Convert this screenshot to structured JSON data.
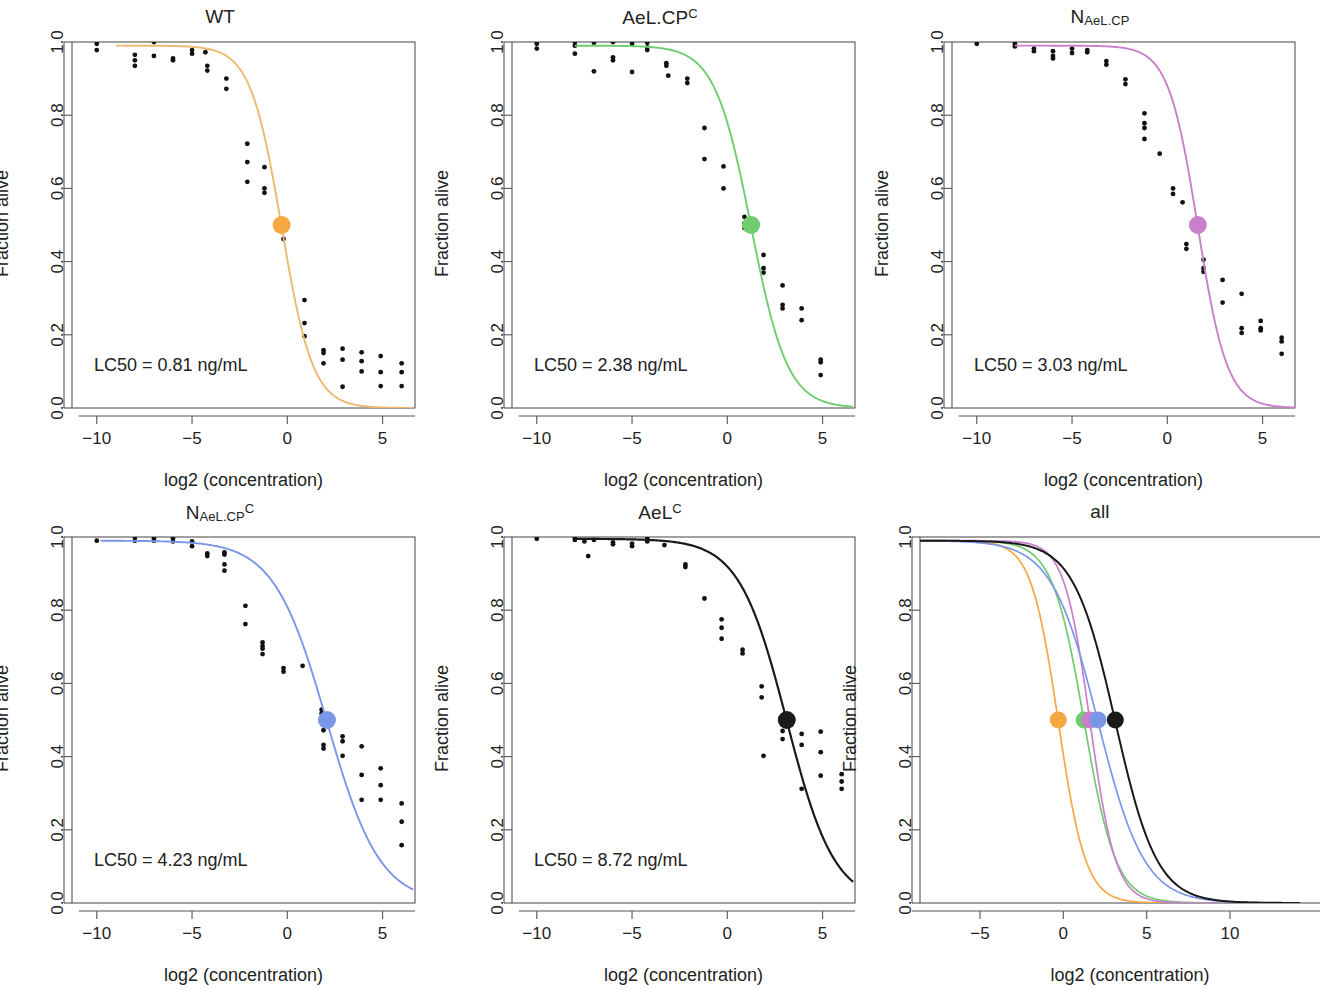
{
  "figure": {
    "axis_labels": {
      "x": "log2 (concentration)",
      "y": "Fraction alive"
    },
    "colors": {
      "wt": "#F5A742",
      "wt_curve": "#EEB96E",
      "aelcpc": "#6FCC6F",
      "n_aelcp": "#C97FC9",
      "n_aelcpc": "#7B96E8",
      "aelc": "#1A1A1A",
      "points": "#111111",
      "axis": "#555555"
    }
  },
  "chart_data": {
    "type": "line",
    "xlabel": "log2 (concentration)",
    "ylabel": "Fraction alive",
    "ylim": [
      0.0,
      1.0
    ],
    "yticks": [
      "0.0",
      "0.2",
      "0.4",
      "0.6",
      "0.8",
      "1.0"
    ],
    "ytick_values": [
      0.0,
      0.2,
      0.4,
      0.6,
      0.8,
      1.0
    ],
    "grid": false,
    "legend": "none",
    "panels": [
      {
        "id": "wt",
        "title_main": "WT",
        "title_sub": "",
        "title_sup": "",
        "lc50_label": "LC50 = 0.81 ng/mL",
        "lc50_value": 0.81,
        "lc50_log2": -0.3,
        "color": "#F5A742",
        "curve_color": "#EEB96E",
        "xlim": [
          -11.3,
          6.7
        ],
        "xticks": [
          "-10",
          "-5",
          "0",
          "5"
        ],
        "xtick_values": [
          -10,
          -5,
          0,
          5
        ],
        "hill_slope": 1.22,
        "top": 0.99,
        "bottom": 0.0,
        "curve_x_range": [
          -9.0,
          6.6
        ],
        "points": [
          [
            -10.0,
            0.995
          ],
          [
            -10.0,
            0.978
          ],
          [
            -8.0,
            0.965
          ],
          [
            -8.0,
            0.95
          ],
          [
            -8.0,
            0.935
          ],
          [
            -7.0,
            1.0
          ],
          [
            -7.0,
            0.962
          ],
          [
            -6.0,
            0.955
          ],
          [
            -6.0,
            0.95
          ],
          [
            -5.0,
            0.978
          ],
          [
            -5.0,
            0.968
          ],
          [
            -4.3,
            0.972
          ],
          [
            -4.2,
            0.935
          ],
          [
            -4.2,
            0.922
          ],
          [
            -3.2,
            0.9
          ],
          [
            -3.2,
            0.872
          ],
          [
            -2.1,
            0.722
          ],
          [
            -2.1,
            0.672
          ],
          [
            -2.1,
            0.618
          ],
          [
            -1.2,
            0.658
          ],
          [
            -1.2,
            0.6
          ],
          [
            -1.2,
            0.588
          ],
          [
            -0.2,
            0.493
          ],
          [
            -0.2,
            0.462
          ],
          [
            0.9,
            0.295
          ],
          [
            0.9,
            0.232
          ],
          [
            0.9,
            0.196
          ],
          [
            1.9,
            0.158
          ],
          [
            1.9,
            0.15
          ],
          [
            1.9,
            0.122
          ],
          [
            2.9,
            0.162
          ],
          [
            2.9,
            0.132
          ],
          [
            2.9,
            0.058
          ],
          [
            3.9,
            0.152
          ],
          [
            3.9,
            0.128
          ],
          [
            3.9,
            0.1
          ],
          [
            4.9,
            0.142
          ],
          [
            4.9,
            0.098
          ],
          [
            4.9,
            0.06
          ],
          [
            6.0,
            0.122
          ],
          [
            6.0,
            0.098
          ],
          [
            6.0,
            0.06
          ]
        ]
      },
      {
        "id": "aelcpc",
        "title_main": "AeL.CP",
        "title_sub": "",
        "title_sup": "C",
        "lc50_label": "LC50 = 2.38 ng/mL",
        "lc50_value": 2.38,
        "lc50_log2": 1.25,
        "color": "#6FCC6F",
        "curve_color": "#6FCC6F",
        "xlim": [
          -11.3,
          6.7
        ],
        "xticks": [
          "-10",
          "-5",
          "0",
          "5"
        ],
        "xtick_values": [
          -10,
          -5,
          0,
          5
        ],
        "hill_slope": 1.05,
        "top": 0.99,
        "bottom": 0.0,
        "curve_x_range": [
          -8.0,
          6.6
        ],
        "points": [
          [
            -10.0,
            0.995
          ],
          [
            -10.0,
            0.982
          ],
          [
            -8.0,
            1.0
          ],
          [
            -8.0,
            0.99
          ],
          [
            -8.0,
            0.968
          ],
          [
            -7.0,
            0.998
          ],
          [
            -7.0,
            0.92
          ],
          [
            -6.0,
            1.0
          ],
          [
            -6.0,
            0.958
          ],
          [
            -6.0,
            0.95
          ],
          [
            -5.0,
            0.995
          ],
          [
            -5.0,
            0.918
          ],
          [
            -4.2,
            0.998
          ],
          [
            -4.2,
            0.985
          ],
          [
            -4.2,
            0.978
          ],
          [
            -3.2,
            0.942
          ],
          [
            -3.2,
            0.935
          ],
          [
            -3.1,
            0.908
          ],
          [
            -2.1,
            0.9
          ],
          [
            -2.1,
            0.888
          ],
          [
            -1.2,
            0.765
          ],
          [
            -1.2,
            0.68
          ],
          [
            -0.2,
            0.66
          ],
          [
            -0.2,
            0.6
          ],
          [
            0.9,
            0.522
          ],
          [
            0.9,
            0.505
          ],
          [
            0.9,
            0.492
          ],
          [
            1.9,
            0.418
          ],
          [
            1.9,
            0.382
          ],
          [
            1.9,
            0.37
          ],
          [
            2.9,
            0.335
          ],
          [
            2.9,
            0.282
          ],
          [
            2.9,
            0.272
          ],
          [
            3.9,
            0.272
          ],
          [
            3.9,
            0.24
          ],
          [
            4.9,
            0.132
          ],
          [
            4.9,
            0.125
          ],
          [
            4.9,
            0.09
          ]
        ]
      },
      {
        "id": "n_aelcp",
        "title_main": "N",
        "title_sub": "AeL.CP",
        "title_sup": "",
        "lc50_label": "LC50 = 3.03 ng/mL",
        "lc50_value": 3.03,
        "lc50_log2": 1.6,
        "color": "#C97FC9",
        "curve_color": "#C97FC9",
        "xlim": [
          -11.3,
          6.7
        ],
        "xticks": [
          "-10",
          "-5",
          "0",
          "5"
        ],
        "xtick_values": [
          -10,
          -5,
          0,
          5
        ],
        "hill_slope": 1.3,
        "top": 0.99,
        "bottom": 0.0,
        "curve_x_range": [
          -8.0,
          7.2
        ],
        "points": [
          [
            -10.0,
            0.995
          ],
          [
            -8.0,
            0.995
          ],
          [
            -8.0,
            0.988
          ],
          [
            -7.0,
            0.982
          ],
          [
            -7.0,
            0.975
          ],
          [
            -6.0,
            0.975
          ],
          [
            -6.0,
            0.962
          ],
          [
            -6.0,
            0.955
          ],
          [
            -5.0,
            0.982
          ],
          [
            -5.0,
            0.97
          ],
          [
            -4.2,
            0.978
          ],
          [
            -4.2,
            0.972
          ],
          [
            -3.2,
            0.948
          ],
          [
            -3.2,
            0.938
          ],
          [
            -2.2,
            0.898
          ],
          [
            -2.2,
            0.885
          ],
          [
            -1.2,
            0.805
          ],
          [
            -1.2,
            0.778
          ],
          [
            -1.2,
            0.765
          ],
          [
            -1.2,
            0.735
          ],
          [
            -0.4,
            0.695
          ],
          [
            0.3,
            0.6
          ],
          [
            0.3,
            0.585
          ],
          [
            0.8,
            0.562
          ],
          [
            1.0,
            0.448
          ],
          [
            1.0,
            0.435
          ],
          [
            1.9,
            0.405
          ],
          [
            1.9,
            0.382
          ],
          [
            1.9,
            0.372
          ],
          [
            2.9,
            0.35
          ],
          [
            2.9,
            0.288
          ],
          [
            3.9,
            0.312
          ],
          [
            3.9,
            0.218
          ],
          [
            3.9,
            0.205
          ],
          [
            4.9,
            0.238
          ],
          [
            4.9,
            0.218
          ],
          [
            4.9,
            0.212
          ],
          [
            6.0,
            0.192
          ],
          [
            6.0,
            0.182
          ],
          [
            6.0,
            0.148
          ]
        ]
      },
      {
        "id": "n_aelcpc",
        "title_main": "N",
        "title_sub": "AeL.CP",
        "title_sup": "C",
        "lc50_label": "LC50 = 4.23 ng/mL",
        "lc50_value": 4.23,
        "lc50_log2": 2.08,
        "color": "#7B96E8",
        "curve_color": "#7B96E8",
        "xlim": [
          -11.3,
          6.7
        ],
        "xticks": [
          "-10",
          "-5",
          "0",
          "5"
        ],
        "xtick_values": [
          -10,
          -5,
          0,
          5
        ],
        "hill_slope": 0.72,
        "top": 0.99,
        "bottom": 0.0,
        "curve_x_range": [
          -9.8,
          6.6
        ],
        "points": [
          [
            -10.0,
            0.99
          ],
          [
            -8.0,
            1.0
          ],
          [
            -8.0,
            0.99
          ],
          [
            -7.0,
            0.995
          ],
          [
            -7.0,
            0.99
          ],
          [
            -6.0,
            0.995
          ],
          [
            -6.0,
            0.988
          ],
          [
            -5.0,
            0.988
          ],
          [
            -5.0,
            0.975
          ],
          [
            -4.2,
            0.955
          ],
          [
            -4.2,
            0.948
          ],
          [
            -3.3,
            0.958
          ],
          [
            -3.3,
            0.952
          ],
          [
            -3.3,
            0.925
          ],
          [
            -3.3,
            0.908
          ],
          [
            -2.2,
            0.812
          ],
          [
            -2.2,
            0.762
          ],
          [
            -1.3,
            0.712
          ],
          [
            -1.3,
            0.702
          ],
          [
            -1.3,
            0.68
          ],
          [
            -1.3,
            0.695
          ],
          [
            -0.2,
            0.642
          ],
          [
            -0.2,
            0.632
          ],
          [
            0.8,
            0.648
          ],
          [
            1.8,
            0.528
          ],
          [
            1.8,
            0.518
          ],
          [
            1.9,
            0.472
          ],
          [
            1.9,
            0.432
          ],
          [
            1.9,
            0.422
          ],
          [
            2.9,
            0.455
          ],
          [
            2.9,
            0.442
          ],
          [
            2.9,
            0.402
          ],
          [
            3.9,
            0.428
          ],
          [
            3.9,
            0.35
          ],
          [
            4.9,
            0.368
          ],
          [
            4.9,
            0.322
          ],
          [
            4.9,
            0.282
          ],
          [
            3.9,
            0.282
          ],
          [
            6.0,
            0.272
          ],
          [
            6.0,
            0.222
          ],
          [
            6.0,
            0.158
          ]
        ]
      },
      {
        "id": "aelc",
        "title_main": "AeL",
        "title_sub": "",
        "title_sup": "C",
        "lc50_label": "LC50 = 8.72 ng/mL",
        "lc50_value": 8.72,
        "lc50_log2": 3.12,
        "color": "#1A1A1A",
        "curve_color": "#1A1A1A",
        "xlim": [
          -11.3,
          6.7
        ],
        "xticks": [
          "-10",
          "-5",
          "0",
          "5"
        ],
        "xtick_values": [
          -10,
          -5,
          0,
          5
        ],
        "hill_slope": 0.8,
        "top": 0.995,
        "bottom": 0.0,
        "curve_x_range": [
          -8.0,
          6.6
        ],
        "points": [
          [
            -10.0,
            0.995
          ],
          [
            -8.0,
            0.998
          ],
          [
            -8.0,
            0.992
          ],
          [
            -7.5,
            0.988
          ],
          [
            -7.3,
            0.948
          ],
          [
            -7.0,
            0.992
          ],
          [
            -6.0,
            0.985
          ],
          [
            -6.0,
            0.98
          ],
          [
            -5.0,
            0.982
          ],
          [
            -5.0,
            0.975
          ],
          [
            -4.2,
            0.995
          ],
          [
            -4.2,
            0.988
          ],
          [
            -3.3,
            0.978
          ],
          [
            -2.2,
            0.925
          ],
          [
            -2.2,
            0.918
          ],
          [
            -1.2,
            0.832
          ],
          [
            -0.3,
            0.775
          ],
          [
            -0.3,
            0.752
          ],
          [
            -0.3,
            0.722
          ],
          [
            0.8,
            0.692
          ],
          [
            0.8,
            0.682
          ],
          [
            1.8,
            0.592
          ],
          [
            1.8,
            0.562
          ],
          [
            2.9,
            0.47
          ],
          [
            2.9,
            0.448
          ],
          [
            1.9,
            0.402
          ],
          [
            3.9,
            0.462
          ],
          [
            3.9,
            0.432
          ],
          [
            4.9,
            0.468
          ],
          [
            4.9,
            0.412
          ],
          [
            4.9,
            0.348
          ],
          [
            3.9,
            0.312
          ],
          [
            6.0,
            0.352
          ],
          [
            6.0,
            0.332
          ],
          [
            6.0,
            0.312
          ]
        ]
      },
      {
        "id": "all",
        "title_main": "all",
        "title_sub": "",
        "title_sup": "",
        "lc50_label": "",
        "xlim": [
          -8.6,
          14.2
        ],
        "xticks": [
          "-5",
          "0",
          "5",
          "10"
        ],
        "xtick_values": [
          -5,
          0,
          5,
          10
        ],
        "series": [
          {
            "name": "WT",
            "color": "#F5A742",
            "lc50_log2": -0.3,
            "hill_slope": 1.22,
            "x_end": 7.8
          },
          {
            "name": "AeL.CPC",
            "color": "#6FCC6F",
            "lc50_log2": 1.25,
            "hill_slope": 1.05,
            "x_end": 9.6
          },
          {
            "name": "NAeL.CP",
            "color": "#C97FC9",
            "lc50_log2": 1.6,
            "hill_slope": 1.3,
            "x_end": 10.9
          },
          {
            "name": "NAeL.CPC",
            "color": "#7B96E8",
            "lc50_log2": 2.08,
            "hill_slope": 0.72,
            "x_end": 14.2
          },
          {
            "name": "AeLC",
            "color": "#1A1A1A",
            "lc50_log2": 3.12,
            "hill_slope": 0.8,
            "x_end": 14.2
          }
        ]
      }
    ]
  }
}
